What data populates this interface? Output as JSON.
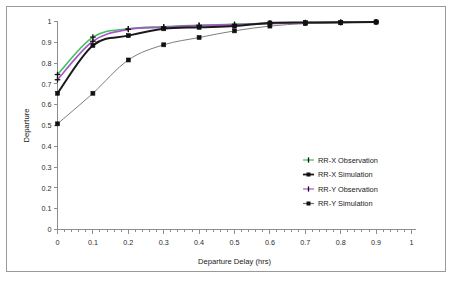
{
  "chart_data": {
    "type": "line",
    "title": "",
    "subtitle": "",
    "xlabel": "Departure Delay (hrs)",
    "ylabel": "Departure",
    "xlim": [
      0,
      1
    ],
    "ylim": [
      0,
      1
    ],
    "xticks": [
      "0",
      "0.1",
      "0.2",
      "0.3",
      "0.4",
      "0.5",
      "0.6",
      "0.7",
      "0.8",
      "0.9",
      "1"
    ],
    "xtick_values": [
      0,
      0.1,
      0.2,
      0.3,
      0.4,
      0.5,
      0.6,
      0.7,
      0.8,
      0.9,
      1
    ],
    "yticks": [
      "0",
      "0.1",
      "0.2",
      "0.3",
      "0.4",
      "0.5",
      "0.6",
      "0.7",
      "0.8",
      "0.9",
      "1"
    ],
    "ytick_values": [
      0,
      0.1,
      0.2,
      0.3,
      0.4,
      0.5,
      0.6,
      0.7,
      0.8,
      0.9,
      1
    ],
    "grid": false,
    "legend_position": "inside-lower-right",
    "x": [
      0,
      0.1,
      0.2,
      0.3,
      0.4,
      0.5,
      0.6,
      0.7,
      0.8,
      0.9
    ],
    "series": [
      {
        "name": "RR-X Observation",
        "color": "#3fbf5f",
        "marker": "plus",
        "values": [
          0.745,
          0.925,
          0.965,
          0.975,
          0.982,
          0.986,
          0.992,
          0.995,
          0.996,
          0.998
        ]
      },
      {
        "name": "RR-X Simulation",
        "color": "#1a1a1a",
        "marker": "square",
        "values": [
          0.655,
          0.885,
          0.932,
          0.965,
          0.972,
          0.978,
          0.993,
          0.995,
          0.996,
          0.998
        ]
      },
      {
        "name": "RR-Y Observation",
        "color": "#a855c8",
        "marker": "plus",
        "values": [
          0.72,
          0.905,
          0.962,
          0.972,
          0.98,
          0.985,
          0.99,
          0.994,
          0.996,
          0.998
        ]
      },
      {
        "name": "RR-Y Simulation",
        "color": "#6e6e6e",
        "marker": "square",
        "values": [
          0.508,
          0.655,
          0.815,
          0.888,
          0.923,
          0.955,
          0.978,
          0.99,
          0.994,
          0.997
        ]
      }
    ]
  },
  "legend": {
    "entries": [
      {
        "label": "RR-X Observation"
      },
      {
        "label": "RR-X Simulation"
      },
      {
        "label": "RR-Y Observation"
      },
      {
        "label": "RR-Y Simulation"
      }
    ]
  }
}
